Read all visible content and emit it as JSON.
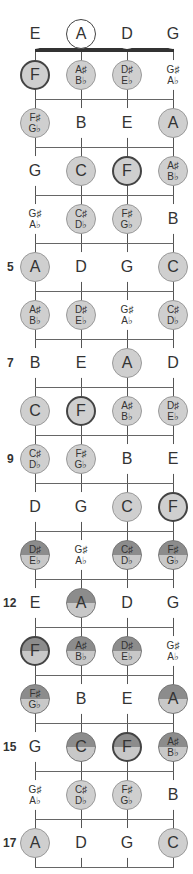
{
  "diagram": {
    "strings": [
      "E",
      "A",
      "D",
      "G"
    ],
    "open_notes": [
      {
        "label": "E",
        "style": "plain"
      },
      {
        "label": "A",
        "style": "open-ring"
      },
      {
        "label": "D",
        "style": "plain"
      },
      {
        "label": "G",
        "style": "plain"
      }
    ],
    "fret_markers": [
      {
        "fret": 5,
        "label": "5"
      },
      {
        "fret": 7,
        "label": "7"
      },
      {
        "fret": 9,
        "label": "9"
      },
      {
        "fret": 12,
        "label": "12"
      },
      {
        "fret": 15,
        "label": "15"
      },
      {
        "fret": 17,
        "label": "17"
      }
    ],
    "frets": [
      {
        "fret": 1,
        "notes": [
          [
            "F",
            "",
            "lite ring"
          ],
          [
            "A♯",
            "B♭",
            "lite"
          ],
          [
            "D♯",
            "E♭",
            "lite"
          ],
          [
            "G♯",
            "A♭",
            "plain"
          ]
        ]
      },
      {
        "fret": 2,
        "notes": [
          [
            "F♯",
            "G♭",
            "lite"
          ],
          [
            "B",
            "",
            "plain"
          ],
          [
            "E",
            "",
            "plain"
          ],
          [
            "A",
            "",
            "lite"
          ]
        ]
      },
      {
        "fret": 3,
        "notes": [
          [
            "G",
            "",
            "plain"
          ],
          [
            "C",
            "",
            "lite"
          ],
          [
            "F",
            "",
            "lite ring"
          ],
          [
            "A♯",
            "B♭",
            "lite"
          ]
        ]
      },
      {
        "fret": 4,
        "notes": [
          [
            "G♯",
            "A♭",
            "plain"
          ],
          [
            "C♯",
            "D♭",
            "lite"
          ],
          [
            "F♯",
            "G♭",
            "lite"
          ],
          [
            "B",
            "",
            "plain"
          ]
        ]
      },
      {
        "fret": 5,
        "notes": [
          [
            "A",
            "",
            "lite"
          ],
          [
            "D",
            "",
            "plain"
          ],
          [
            "G",
            "",
            "plain"
          ],
          [
            "C",
            "",
            "lite"
          ]
        ]
      },
      {
        "fret": 6,
        "notes": [
          [
            "A♯",
            "B♭",
            "lite"
          ],
          [
            "D♯",
            "E♭",
            "lite"
          ],
          [
            "G♯",
            "A♭",
            "plain"
          ],
          [
            "C♯",
            "D♭",
            "lite"
          ]
        ]
      },
      {
        "fret": 7,
        "notes": [
          [
            "B",
            "",
            "plain"
          ],
          [
            "E",
            "",
            "plain"
          ],
          [
            "A",
            "",
            "lite"
          ],
          [
            "D",
            "",
            "plain"
          ]
        ]
      },
      {
        "fret": 8,
        "notes": [
          [
            "C",
            "",
            "lite"
          ],
          [
            "F",
            "",
            "lite ring"
          ],
          [
            "A♯",
            "B♭",
            "lite"
          ],
          [
            "D♯",
            "E♭",
            "lite"
          ]
        ]
      },
      {
        "fret": 9,
        "notes": [
          [
            "C♯",
            "D♭",
            "lite"
          ],
          [
            "F♯",
            "G♭",
            "lite"
          ],
          [
            "B",
            "",
            "plain"
          ],
          [
            "E",
            "",
            "plain"
          ]
        ]
      },
      {
        "fret": 10,
        "notes": [
          [
            "D",
            "",
            "plain"
          ],
          [
            "G",
            "",
            "plain"
          ],
          [
            "C",
            "",
            "lite"
          ],
          [
            "F",
            "",
            "lite ring"
          ]
        ]
      },
      {
        "fret": 11,
        "notes": [
          [
            "D♯",
            "E♭",
            "half"
          ],
          [
            "G♯",
            "A♭",
            "plain"
          ],
          [
            "C♯",
            "D♭",
            "half"
          ],
          [
            "F♯",
            "G♭",
            "half"
          ]
        ]
      },
      {
        "fret": 12,
        "notes": [
          [
            "E",
            "",
            "plain"
          ],
          [
            "A",
            "",
            "half"
          ],
          [
            "D",
            "",
            "plain"
          ],
          [
            "G",
            "",
            "plain"
          ]
        ]
      },
      {
        "fret": 13,
        "notes": [
          [
            "F",
            "",
            "half ring"
          ],
          [
            "A♯",
            "B♭",
            "half"
          ],
          [
            "D♯",
            "E♭",
            "half"
          ],
          [
            "G♯",
            "A♭",
            "plain"
          ]
        ]
      },
      {
        "fret": 14,
        "notes": [
          [
            "F♯",
            "G♭",
            "half"
          ],
          [
            "B",
            "",
            "plain"
          ],
          [
            "E",
            "",
            "plain"
          ],
          [
            "A",
            "",
            "half"
          ]
        ]
      },
      {
        "fret": 15,
        "notes": [
          [
            "G",
            "",
            "plain"
          ],
          [
            "C",
            "",
            "half"
          ],
          [
            "F",
            "",
            "half ring"
          ],
          [
            "A♯",
            "B♭",
            "half"
          ]
        ]
      },
      {
        "fret": 16,
        "notes": [
          [
            "G♯",
            "A♭",
            "plain"
          ],
          [
            "C♯",
            "D♭",
            "lite"
          ],
          [
            "F♯",
            "G♭",
            "lite"
          ],
          [
            "B",
            "",
            "plain"
          ]
        ]
      },
      {
        "fret": 17,
        "notes": [
          [
            "A",
            "",
            "lite"
          ],
          [
            "D",
            "",
            "plain"
          ],
          [
            "G",
            "",
            "plain"
          ],
          [
            "C",
            "",
            "lite"
          ]
        ]
      }
    ],
    "colors": {
      "light_fill": "#cfcfcf",
      "dark_fill": "#8c8c8c",
      "line": "#555555",
      "text": "#333333"
    }
  }
}
